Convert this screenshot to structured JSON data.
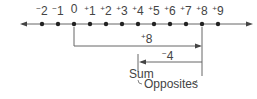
{
  "number_line": {
    "ticks": [
      {
        "sign": "−",
        "num": "2",
        "value": -2,
        "x": 42
      },
      {
        "sign": "−",
        "num": "1",
        "value": -1,
        "x": 58
      },
      {
        "sign": "",
        "num": "0",
        "value": 0,
        "x": 74
      },
      {
        "sign": "+",
        "num": "1",
        "value": 1,
        "x": 90
      },
      {
        "sign": "+",
        "num": "2",
        "value": 2,
        "x": 106
      },
      {
        "sign": "+",
        "num": "3",
        "value": 3,
        "x": 122
      },
      {
        "sign": "+",
        "num": "4",
        "value": 4,
        "x": 138
      },
      {
        "sign": "+",
        "num": "5",
        "value": 5,
        "x": 154
      },
      {
        "sign": "+",
        "num": "6",
        "value": 6,
        "x": 170
      },
      {
        "sign": "+",
        "num": "7",
        "value": 7,
        "x": 186
      },
      {
        "sign": "+",
        "num": "8",
        "value": 8,
        "x": 202
      },
      {
        "sign": "+",
        "num": "9",
        "value": 9,
        "x": 218
      }
    ]
  },
  "arrows": {
    "first": {
      "sign": "+",
      "num": "8",
      "from": 0,
      "to": 8
    },
    "second": {
      "sign": "−",
      "num": "4",
      "from": 8,
      "to": 4
    }
  },
  "labels": {
    "sum": "Sum",
    "opposites": "Opposites"
  },
  "colors": {
    "line": "#555555",
    "text": "#444444"
  }
}
